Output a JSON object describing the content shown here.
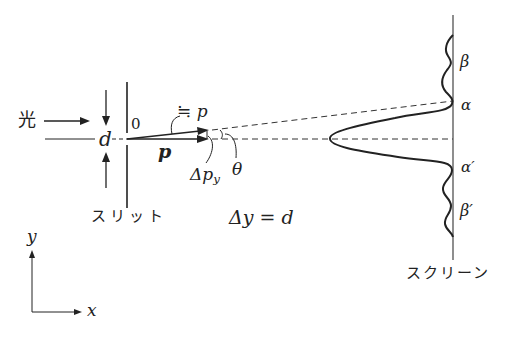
{
  "figure": {
    "type": "single-slit diffraction / uncertainty principle diagram",
    "colors": {
      "ink": "#222222",
      "background": "#ffffff"
    }
  },
  "labels": {
    "light": "光",
    "slit_width": "d",
    "origin": "0",
    "momentum": "p",
    "approx_momentum": "≒ p",
    "delta_py": "Δp",
    "delta_py_sub": "y",
    "theta": "θ",
    "slit": "スリット",
    "delta_y_eq": "Δy = d",
    "screen": "スクリーン",
    "alpha": "α",
    "beta": "β",
    "alpha_prime": "α′",
    "beta_prime": "β′",
    "axis_y": "y",
    "axis_x": "x"
  }
}
